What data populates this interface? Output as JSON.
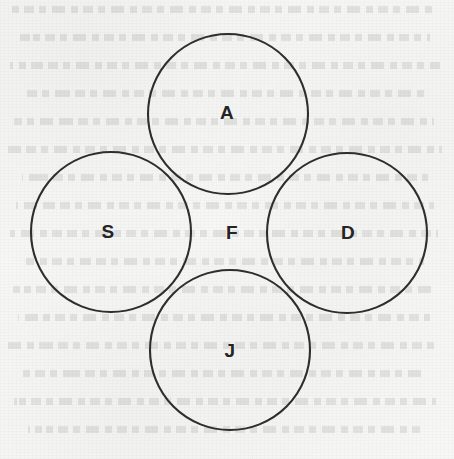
{
  "page": {
    "background_color": "#f7f7f6",
    "ink_color": "#2e2e2e",
    "label_color": "#242424",
    "width": 454,
    "height": 459
  },
  "diagram": {
    "type": "venn",
    "title": "",
    "circle_count": 4,
    "stroke_width": 2.1,
    "circles": [
      {
        "id": "A",
        "label": "A",
        "cx": 228,
        "cy": 114,
        "r": 80,
        "position": "top"
      },
      {
        "id": "S",
        "label": "S",
        "cx": 111,
        "cy": 232,
        "r": 80,
        "position": "left"
      },
      {
        "id": "D",
        "label": "D",
        "cx": 347,
        "cy": 233,
        "r": 80,
        "position": "right"
      },
      {
        "id": "J",
        "label": "J",
        "cx": 230,
        "cy": 350,
        "r": 80,
        "position": "bottom"
      }
    ],
    "region_labels": [
      {
        "id": "A",
        "text": "A",
        "x": 227,
        "y": 112
      },
      {
        "id": "S",
        "text": "S",
        "x": 108,
        "y": 231
      },
      {
        "id": "F",
        "text": "F",
        "x": 232,
        "y": 232
      },
      {
        "id": "D",
        "text": "D",
        "x": 348,
        "y": 232
      },
      {
        "id": "J",
        "text": "J",
        "x": 230,
        "y": 350
      }
    ]
  },
  "ghost_text_rows": [
    {
      "top": 6,
      "left": 12,
      "width": 424
    },
    {
      "top": 34,
      "left": 20,
      "width": 410
    },
    {
      "top": 62,
      "left": 10,
      "width": 430
    },
    {
      "top": 90,
      "left": 24,
      "width": 402
    },
    {
      "top": 118,
      "left": 14,
      "width": 420
    },
    {
      "top": 146,
      "left": 8,
      "width": 434
    },
    {
      "top": 174,
      "left": 22,
      "width": 406
    },
    {
      "top": 202,
      "left": 16,
      "width": 418
    },
    {
      "top": 230,
      "left": 10,
      "width": 428
    },
    {
      "top": 258,
      "left": 26,
      "width": 398
    },
    {
      "top": 286,
      "left": 12,
      "width": 424
    },
    {
      "top": 314,
      "left": 18,
      "width": 412
    },
    {
      "top": 342,
      "left": 8,
      "width": 432
    },
    {
      "top": 370,
      "left": 22,
      "width": 404
    },
    {
      "top": 398,
      "left": 14,
      "width": 422
    },
    {
      "top": 426,
      "left": 28,
      "width": 392
    }
  ]
}
